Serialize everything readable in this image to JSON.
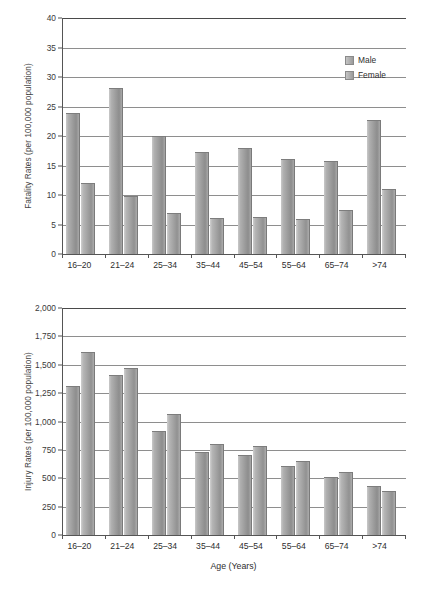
{
  "chart_data": [
    {
      "id": "fatality",
      "type": "bar",
      "title": "",
      "ylabel": "Fatality Rates (per 100,000 population)",
      "xlabel": "",
      "categories": [
        "16–20",
        "21–24",
        "25–34",
        "35–44",
        "45–54",
        "55–64",
        "65–74",
        ">74"
      ],
      "series": [
        {
          "name": "Male",
          "values": [
            23.8,
            28.0,
            19.9,
            17.1,
            17.8,
            15.9,
            15.6,
            22.5
          ]
        },
        {
          "name": "Female",
          "values": [
            11.9,
            9.7,
            6.7,
            5.9,
            6.1,
            5.7,
            7.3,
            10.8
          ]
        }
      ],
      "ylim": [
        0,
        40
      ],
      "yticks": [
        0,
        5,
        10,
        15,
        20,
        25,
        30,
        35,
        40
      ],
      "ytick_labels": [
        "0",
        "5",
        "10",
        "15",
        "20",
        "25",
        "30",
        "35",
        "40"
      ],
      "grid": true,
      "legend_position": "top-right",
      "legend": [
        "Male",
        "Female"
      ]
    },
    {
      "id": "injury",
      "type": "bar",
      "title": "",
      "ylabel": "Injury Rates (per 100,000 population)",
      "xlabel": "Age (Years)",
      "categories": [
        "16–20",
        "21–24",
        "25–34",
        "35–44",
        "45–54",
        "55–64",
        "65–74",
        ">74"
      ],
      "series": [
        {
          "name": "Male",
          "values": [
            1300,
            1400,
            910,
            720,
            700,
            600,
            505,
            425
          ]
        },
        {
          "name": "Female",
          "values": [
            1600,
            1460,
            1060,
            790,
            775,
            645,
            545,
            375
          ]
        }
      ],
      "ylim": [
        0,
        2000
      ],
      "yticks": [
        0,
        250,
        500,
        750,
        1000,
        1250,
        1500,
        1750,
        2000
      ],
      "ytick_labels": [
        "0",
        "250",
        "500",
        "750",
        "1,000",
        "1,250",
        "1,500",
        "1,750",
        "2,000"
      ],
      "grid": true,
      "legend_position": "none",
      "legend": []
    }
  ],
  "colors": {
    "bar_male": "#9a9a9a",
    "bar_female": "#a0a0a0",
    "grid": "#8e8e8e",
    "axis": "#555555",
    "text": "#2e2e2e",
    "background": "#ffffff"
  }
}
